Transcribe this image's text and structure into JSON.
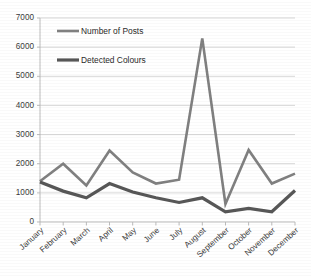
{
  "chart_data": {
    "type": "line",
    "title": "",
    "subtitle": "",
    "xlabel": "",
    "ylabel": "",
    "categories": [
      "January",
      "February",
      "March",
      "April",
      "May",
      "June",
      "July",
      "August",
      "September",
      "October",
      "November",
      "December"
    ],
    "series": [
      {
        "name": "Number of Posts",
        "color": "#808080",
        "stroke_width": 2.6,
        "values": [
          1400,
          2000,
          1250,
          2450,
          1700,
          1320,
          1450,
          6300,
          620,
          2470,
          1320,
          1660
        ]
      },
      {
        "name": "Detected Colours",
        "color": "#575757",
        "stroke_width": 3.2,
        "values": [
          1370,
          1060,
          830,
          1320,
          1030,
          830,
          670,
          830,
          350,
          470,
          350,
          1080
        ]
      }
    ],
    "ylim": [
      0,
      7000
    ],
    "yticks": [
      0,
      1000,
      2000,
      3000,
      4000,
      5000,
      6000,
      7000
    ],
    "ytick_labels": [
      "0",
      "1000",
      "2000",
      "3000",
      "4000",
      "5000",
      "6000",
      "7000"
    ],
    "grid": true,
    "grid_axis": "y",
    "legend": [
      "Number of Posts",
      "Detected Colours"
    ],
    "legend_position": "inside-top-left"
  },
  "legend": {
    "items": [
      {
        "label": "Number of Posts",
        "swatch_name": "legend-swatch-posts"
      },
      {
        "label": "Detected Colours",
        "swatch_name": "legend-swatch-colours"
      }
    ]
  },
  "axes": {
    "y_tick_labels": [
      "7000",
      "6000",
      "5000",
      "4000",
      "3000",
      "2000",
      "1000",
      "0"
    ],
    "x_tick_labels": [
      "January",
      "February",
      "March",
      "April",
      "May",
      "June",
      "July",
      "August",
      "September",
      "October",
      "November",
      "December"
    ]
  },
  "colors": {
    "posts_line": "#808080",
    "colours_line": "#575757",
    "gridline": "#d2d2d2",
    "axis": "#b4b4b4",
    "text": "#3b3b3b",
    "background": "#ffffff"
  }
}
